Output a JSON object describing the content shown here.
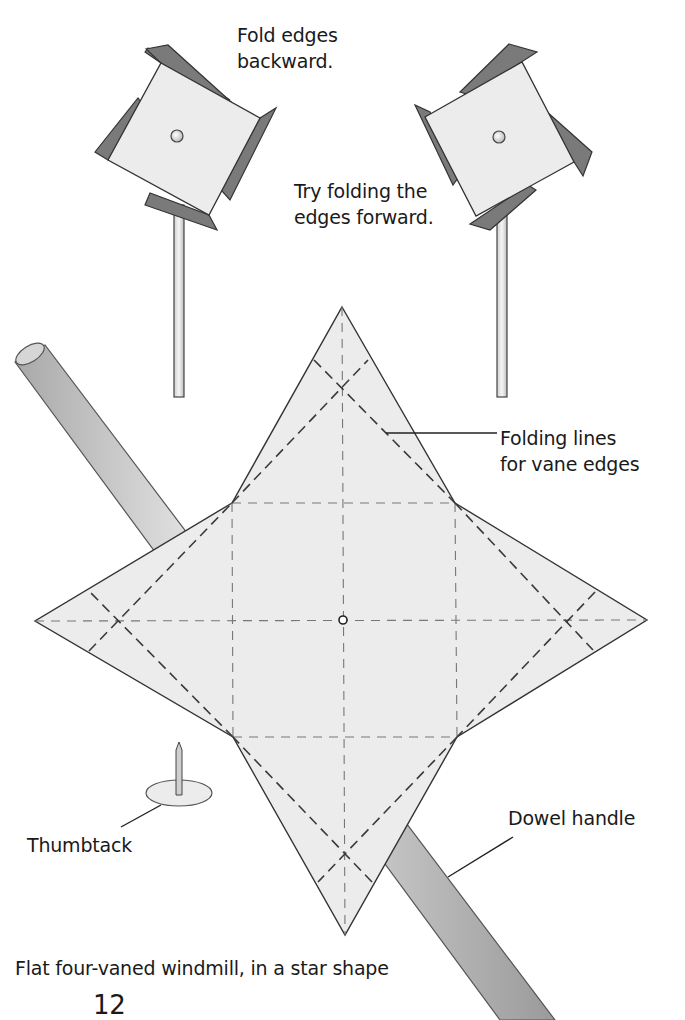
{
  "labels": {
    "fold_backward_line1": "Fold edges",
    "fold_backward_line2": "backward.",
    "fold_forward_line1": "Try folding the",
    "fold_forward_line2": "edges forward.",
    "folding_lines_line1": "Folding lines",
    "folding_lines_line2": "for vane edges",
    "thumbtack": "Thumbtack",
    "dowel_handle": "Dowel handle"
  },
  "caption": "Flat four-vaned windmill, in a star shape",
  "page_number": "12",
  "colors": {
    "paper": "#ececec",
    "vane_flap": "#7a7a7a",
    "outline": "#333333",
    "fold_line": "#555555",
    "dowel": "#c8c8c8"
  }
}
